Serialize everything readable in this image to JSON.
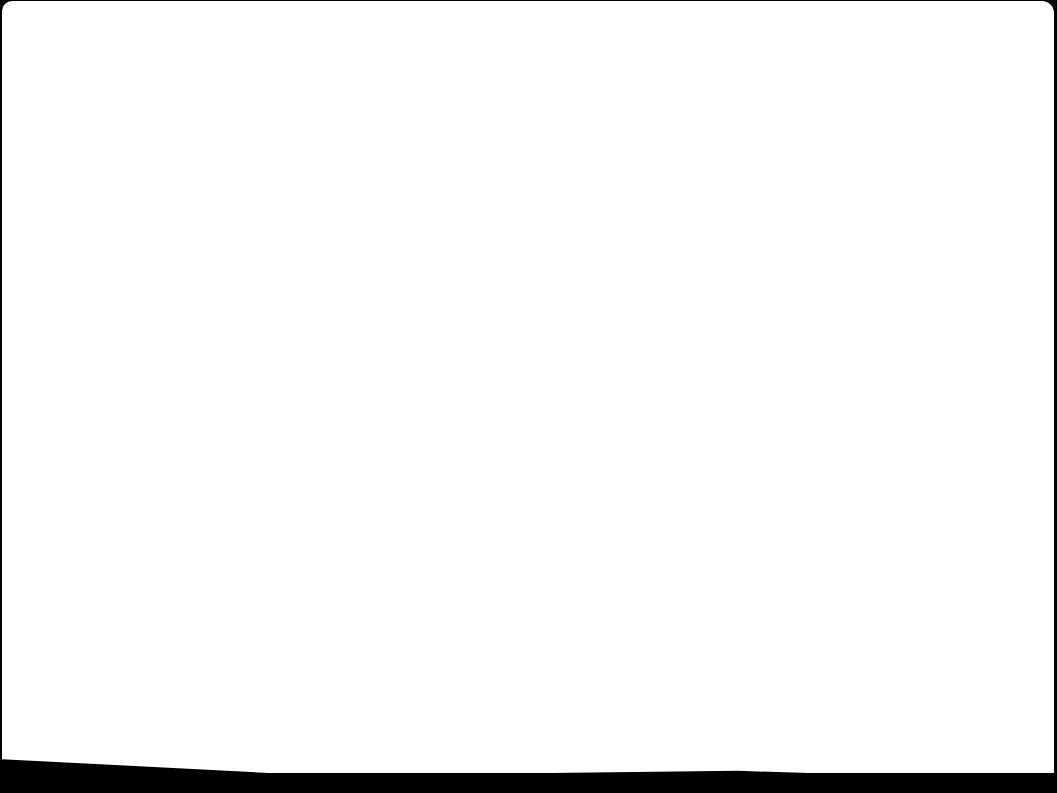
{
  "screen": {
    "state": "blank",
    "background_color": "#ffffff",
    "bezel_color": "#000000"
  }
}
